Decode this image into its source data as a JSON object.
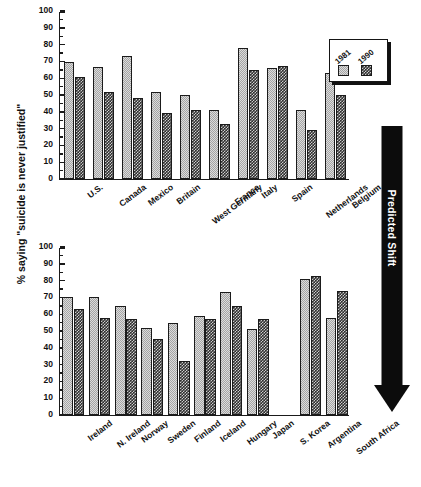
{
  "figure": {
    "ylabel": "% saying \"suicide is never justified\"",
    "annotation": "Predicted Shift",
    "legend": {
      "items": [
        "1981",
        "1990"
      ]
    },
    "colors": {
      "series_1981": "#dcdcdc",
      "series_1990": "#2f2f2f",
      "axis": "#1a1a1a",
      "arrow": "#0c0c0c"
    }
  },
  "chart_data": [
    {
      "type": "bar",
      "title": "",
      "panel": "top",
      "xlabel": "",
      "ylabel": "% saying \"suicide is never justified\"",
      "ylim": [
        0,
        100
      ],
      "yticks": [
        0,
        10,
        20,
        30,
        40,
        50,
        60,
        70,
        80,
        90,
        100
      ],
      "grid": false,
      "legend_position": "top-right",
      "categories": [
        "U.S.",
        "Canada",
        "Mexico",
        "Britain",
        "West Germany",
        "France",
        "Italy",
        "Spain",
        "Netherlands",
        "Belgium"
      ],
      "series": [
        {
          "name": "1981",
          "values": [
            69.5,
            66.5,
            73,
            52,
            50,
            41,
            78,
            66,
            41,
            63
          ]
        },
        {
          "name": "1990",
          "values": [
            60.5,
            51.5,
            48,
            39,
            41,
            33,
            65,
            67,
            29,
            50
          ]
        }
      ]
    },
    {
      "type": "bar",
      "title": "",
      "panel": "bottom",
      "xlabel": "",
      "ylabel": "% saying \"suicide is never justified\"",
      "ylim": [
        0,
        100
      ],
      "yticks": [
        0,
        10,
        20,
        30,
        40,
        50,
        60,
        70,
        80,
        90,
        100
      ],
      "grid": false,
      "legend_position": "none",
      "categories": [
        "Ireland",
        "N. Ireland",
        "Norway",
        "Sweden",
        "Finland",
        "Iceland",
        "Hungary",
        "Japan",
        "S. Korea",
        "Argentina",
        "South Africa"
      ],
      "series": [
        {
          "name": "1981",
          "values": [
            70,
            70,
            65,
            52,
            55,
            59,
            73,
            51,
            null,
            81,
            58
          ]
        },
        {
          "name": "1990",
          "values": [
            63,
            58,
            57,
            45,
            32,
            57,
            65,
            57,
            null,
            82.5,
            74
          ]
        }
      ]
    }
  ]
}
